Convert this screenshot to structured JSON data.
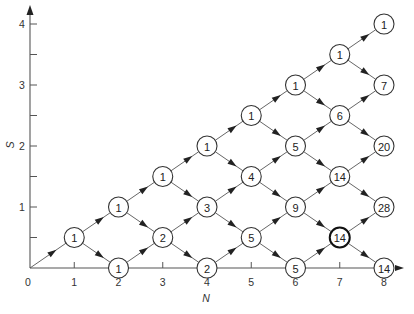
{
  "diagram": {
    "type": "lattice-path-diagram",
    "x_axis": {
      "label": "N",
      "ticks": [
        "0",
        "1",
        "2",
        "3",
        "4",
        "5",
        "6",
        "7",
        "8"
      ]
    },
    "y_axis": {
      "label": "S",
      "ticks": [
        "1",
        "2",
        "3",
        "4"
      ]
    },
    "nodes": [
      {
        "n": 1,
        "s": 0.5,
        "value": "1"
      },
      {
        "n": 2,
        "s": 0,
        "value": "1"
      },
      {
        "n": 2,
        "s": 1,
        "value": "1"
      },
      {
        "n": 3,
        "s": 0.5,
        "value": "2"
      },
      {
        "n": 3,
        "s": 1.5,
        "value": "1"
      },
      {
        "n": 4,
        "s": 0,
        "value": "2"
      },
      {
        "n": 4,
        "s": 1,
        "value": "3"
      },
      {
        "n": 4,
        "s": 2,
        "value": "1"
      },
      {
        "n": 5,
        "s": 0.5,
        "value": "5"
      },
      {
        "n": 5,
        "s": 1.5,
        "value": "4"
      },
      {
        "n": 5,
        "s": 2.5,
        "value": "1"
      },
      {
        "n": 6,
        "s": 0,
        "value": "5"
      },
      {
        "n": 6,
        "s": 1,
        "value": "9"
      },
      {
        "n": 6,
        "s": 2,
        "value": "5"
      },
      {
        "n": 6,
        "s": 3,
        "value": "1"
      },
      {
        "n": 7,
        "s": 0.5,
        "value": "14",
        "bold": true
      },
      {
        "n": 7,
        "s": 1.5,
        "value": "14"
      },
      {
        "n": 7,
        "s": 2.5,
        "value": "6"
      },
      {
        "n": 7,
        "s": 3.5,
        "value": "1"
      },
      {
        "n": 8,
        "s": 0,
        "value": "14"
      },
      {
        "n": 8,
        "s": 1,
        "value": "28"
      },
      {
        "n": 8,
        "s": 2,
        "value": "20"
      },
      {
        "n": 8,
        "s": 3,
        "value": "7"
      },
      {
        "n": 8,
        "s": 4,
        "value": "1"
      }
    ]
  }
}
